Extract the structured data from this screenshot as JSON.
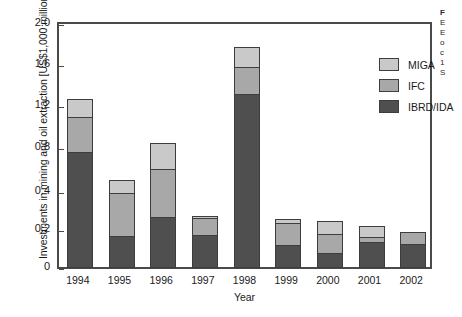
{
  "chart_data": {
    "type": "bar",
    "stacked": true,
    "title": "",
    "xlabel": "Year",
    "ylabel": "Investments in mining and oil extraction [US$1,000 million]",
    "categories": [
      "1994",
      "1995",
      "1996",
      "1997",
      "1998",
      "1999",
      "2000",
      "2001",
      "2002"
    ],
    "series": [
      {
        "name": "IBRD/IDA",
        "color": "#4f4f4f",
        "values": [
          0.95,
          0.26,
          0.42,
          0.27,
          1.43,
          0.19,
          0.12,
          0.21,
          0.2
        ]
      },
      {
        "name": "IFC",
        "color": "#a8a8a8",
        "values": [
          0.3,
          0.36,
          0.4,
          0.15,
          0.23,
          0.19,
          0.17,
          0.05,
          0.1
        ]
      },
      {
        "name": "MIGA",
        "color": "#c9c9c9",
        "values": [
          0.15,
          0.12,
          0.22,
          0.02,
          0.17,
          0.04,
          0.11,
          0.1,
          0.0
        ]
      }
    ],
    "totals": [
      1.4,
      0.74,
      1.04,
      0.44,
      1.83,
      0.42,
      0.4,
      0.36,
      0.3
    ],
    "ylim": [
      0,
      2.0
    ],
    "yticks": [
      2.0,
      1.6,
      1.2,
      0.8,
      0.4,
      0.2,
      0
    ],
    "ytick_labels": [
      "2.0",
      "1.6",
      "1.2",
      "0.8",
      "0.4",
      "0.2",
      "0"
    ],
    "grid": false,
    "legend_position": "top-right",
    "legend_order": [
      "MIGA",
      "IFC",
      "IBRD/IDA"
    ]
  },
  "axes": {
    "y_title": "Investments in mining and oil extraction [US$1,000 million]",
    "x_title": "Year"
  },
  "legend": {
    "entries": [
      {
        "label": "MIGA",
        "swatch_class": "seg-miga"
      },
      {
        "label": "IFC",
        "swatch_class": "seg-ifc"
      },
      {
        "label": "IBRD/IDA",
        "swatch_class": "seg-ibrdida"
      }
    ]
  },
  "caption_sliver": {
    "line1": "F",
    "line2": "E",
    "line3": "E",
    "line4": "o",
    "line5": "c",
    "line6": "1",
    "line7": "S"
  }
}
